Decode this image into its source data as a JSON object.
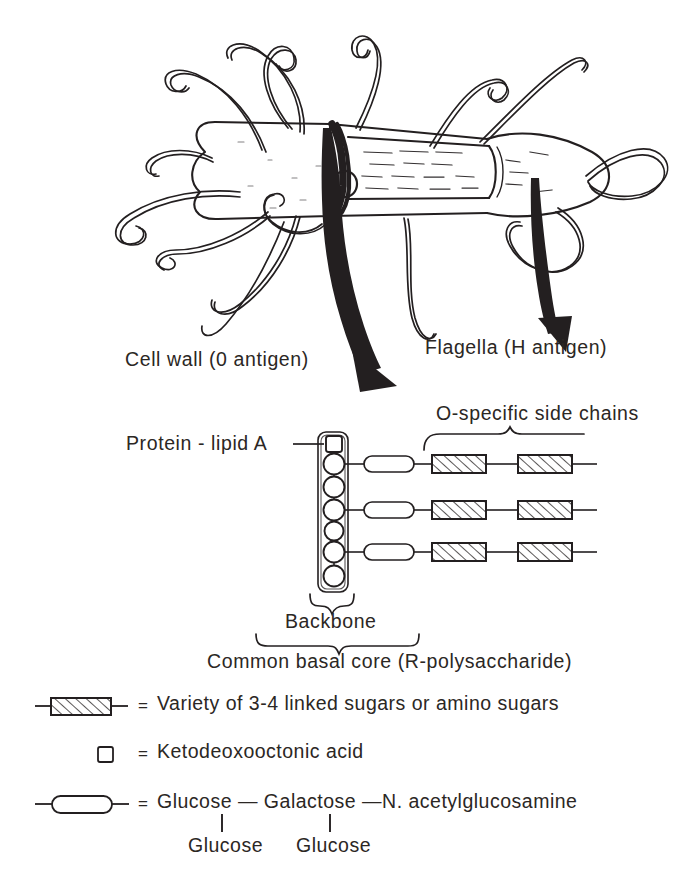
{
  "figure": {
    "title_absent": true,
    "background_color": "#ffffff",
    "ink_color": "#231f20",
    "labels": {
      "cell_wall": "Cell wall  (0  antigen)",
      "flagella": "Flagella (H  antigen)",
      "protein_lipid_a": "Protein - lipid A",
      "o_specific_side_chains": "O-specific  side  chains",
      "backbone": "Backbone",
      "common_basal_core": "Common basal core  (R-polysaccharide)"
    },
    "legend": {
      "equals_sign": "=",
      "entries": [
        {
          "icon": "hatched-sugar-box-icon",
          "text": "Variety of 3-4 linked sugars or amino sugars"
        },
        {
          "icon": "small-square-icon",
          "text": "Ketodeoxooctonic  acid"
        },
        {
          "icon": "capsule-icon",
          "text": "Glucose — Galactose —N. acetylglucosamine"
        }
      ],
      "sub_labels": [
        "Glucose",
        "Glucose"
      ]
    },
    "structure": {
      "backbone_units": {
        "terminal_square": "ketodeoxooctonic-acid-square",
        "circle_count": 7,
        "branch_circle_indices": [
          1,
          3,
          5
        ]
      },
      "side_chain_count": 3,
      "side_chain_units_per_chain": [
        "capsule",
        "hatched-box",
        "hatched-box"
      ]
    },
    "bacterium": {
      "shape": "rod-shaped-bacillus-cutaway",
      "flagella_count": 12
    }
  }
}
